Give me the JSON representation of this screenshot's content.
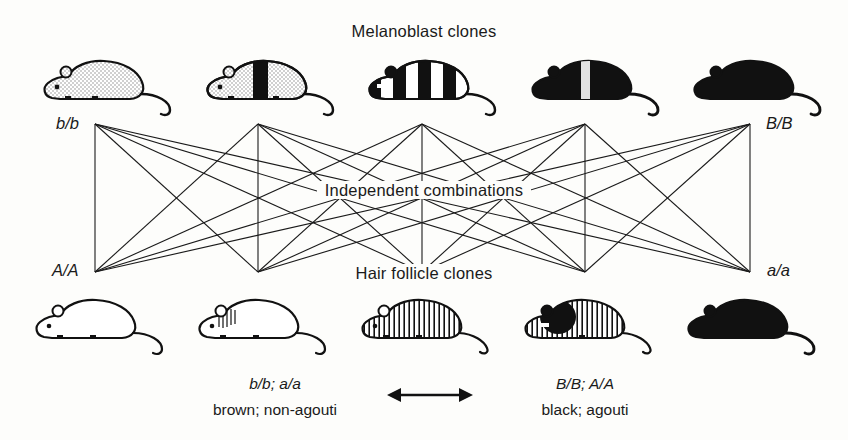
{
  "figure": {
    "top_title": "Melanoblast clones",
    "center_label": "Independent combinations",
    "bottom_title": "Hair follicle clones",
    "corner_labels": {
      "top_left": "b/b",
      "top_right": "B/B",
      "bottom_left": "A/A",
      "bottom_right": "a/a"
    },
    "caption_left": {
      "genotype": "b/b; a/a",
      "phenotype": "brown; non-agouti"
    },
    "caption_right": {
      "genotype": "B/B; A/A",
      "phenotype": "black; agouti"
    },
    "arrow": "double-headed-arrow",
    "colors": {
      "ink": "#111111",
      "paper": "#fdfdfb",
      "stipple": "#d9d9d9"
    },
    "melanoblast_clones": [
      {
        "name": "mouse-melanoblast-1",
        "pattern": "stipple-light",
        "description": "light stippled body, no black bands"
      },
      {
        "name": "mouse-melanoblast-2",
        "pattern": "stipple-one-band",
        "description": "light stippled body with one wide black band"
      },
      {
        "name": "mouse-melanoblast-3",
        "pattern": "striped-black-white",
        "description": "bold alternating black and white vertical stripes"
      },
      {
        "name": "mouse-melanoblast-4",
        "pattern": "black-one-light-band",
        "description": "solid black body with one narrow light band"
      },
      {
        "name": "mouse-melanoblast-5",
        "pattern": "solid-black",
        "description": "entirely solid black body"
      }
    ],
    "hair_follicle_clones": [
      {
        "name": "mouse-follicle-1",
        "pattern": "outline-white",
        "description": "plain outline, no fill"
      },
      {
        "name": "mouse-follicle-2",
        "pattern": "outline-few-hatch",
        "description": "outline with a few hatch lines near the shoulder"
      },
      {
        "name": "mouse-follicle-3",
        "pattern": "full-hatch",
        "description": "body fully filled with fine vertical hatching"
      },
      {
        "name": "mouse-follicle-4",
        "pattern": "hatch-black-patch",
        "description": "vertical hatching with a solid black patch over head and shoulder"
      },
      {
        "name": "mouse-follicle-5",
        "pattern": "solid-black",
        "description": "entirely solid black body"
      }
    ],
    "network": {
      "description": "complete bipartite connection between five melanoblast clone nodes and five hair follicle clone nodes",
      "top_nodes": 5,
      "bottom_nodes": 5,
      "edge_count": 25,
      "node_x": [
        95,
        258,
        422,
        585,
        750
      ],
      "top_y": 124,
      "bottom_y": 272
    }
  }
}
